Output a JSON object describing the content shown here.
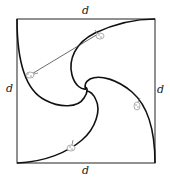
{
  "diagram": {
    "labels": {
      "top": "d",
      "bottom": "d",
      "left": "d",
      "right": "d"
    },
    "square": {
      "x": 17,
      "y": 19,
      "width": 138,
      "height": 144
    },
    "bugs": [
      {
        "name": "bug-top-left-path",
        "x": 30,
        "y": 75
      },
      {
        "name": "bug-top-path",
        "x": 100,
        "y": 35
      },
      {
        "name": "bug-right-path",
        "x": 137,
        "y": 106
      },
      {
        "name": "bug-bottom-path",
        "x": 71,
        "y": 147
      }
    ],
    "colors": {
      "stroke": "#111111",
      "line": "#444444",
      "bug": "#999999"
    }
  }
}
